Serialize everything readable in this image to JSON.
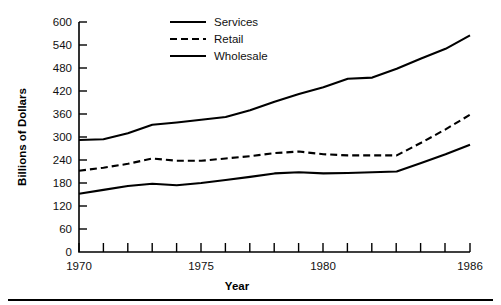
{
  "chart_data": {
    "type": "line",
    "title": "",
    "xlabel": "Year",
    "ylabel": "Billions of Dollars",
    "xlim": [
      1970,
      1986
    ],
    "ylim": [
      0,
      600
    ],
    "grid": false,
    "legend_position": "top-center",
    "x": [
      1970,
      1971,
      1972,
      1973,
      1974,
      1975,
      1976,
      1977,
      1978,
      1979,
      1980,
      1981,
      1982,
      1983,
      1984,
      1985,
      1986
    ],
    "x_tick_labels": [
      "1970",
      "1975",
      "1980",
      "1986"
    ],
    "x_tick_label_values": [
      1970,
      1975,
      1980,
      1986
    ],
    "y_ticks": [
      0,
      60,
      120,
      180,
      240,
      300,
      360,
      420,
      480,
      540,
      600
    ],
    "y_tick_labels": [
      "0",
      "60",
      "120",
      "180",
      "240",
      "300",
      "360",
      "420",
      "480",
      "540",
      "600"
    ],
    "series": [
      {
        "name": "Services",
        "style": "solid",
        "color": "#000000",
        "values": [
          292,
          294,
          310,
          332,
          338,
          345,
          352,
          370,
          392,
          412,
          430,
          452,
          455,
          478,
          505,
          530,
          565
        ]
      },
      {
        "name": "Retail",
        "style": "dashed",
        "color": "#000000",
        "values": [
          212,
          220,
          230,
          244,
          238,
          238,
          244,
          250,
          258,
          262,
          255,
          252,
          252,
          252,
          285,
          320,
          358
        ]
      },
      {
        "name": "Wholesale",
        "style": "solid",
        "color": "#000000",
        "values": [
          152,
          162,
          172,
          178,
          174,
          180,
          188,
          196,
          205,
          208,
          205,
          206,
          208,
          210,
          232,
          255,
          280
        ]
      }
    ]
  },
  "legend": {
    "entries": [
      {
        "label": "Services"
      },
      {
        "label": "Retail"
      },
      {
        "label": "Wholesale"
      }
    ]
  },
  "axes": {
    "y_title": "Billions of Dollars",
    "x_title": "Year",
    "y_labels": {
      "t0": "600",
      "t1": "540",
      "t2": "480",
      "t3": "420",
      "t4": "360",
      "t5": "300",
      "t6": "240",
      "t7": "180",
      "t8": "120",
      "t9": "60",
      "t10": "0"
    },
    "x_labels": {
      "x0": "1970",
      "x1": "1975",
      "x2": "1980",
      "x3": "1986"
    }
  }
}
